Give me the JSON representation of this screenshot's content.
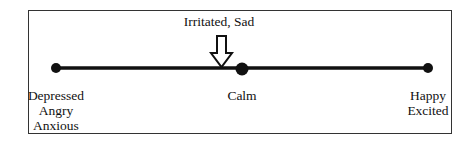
{
  "diagram": {
    "type": "mood-continuum",
    "marker_label": "Irritated, Sad",
    "scale": {
      "left": {
        "lines": [
          "Depressed",
          "Angry",
          "Anxious"
        ]
      },
      "middle": {
        "lines": [
          "Calm"
        ]
      },
      "right": {
        "lines": [
          "Happy",
          "Excited"
        ]
      }
    },
    "marker_position_fraction": 0.44,
    "colors": {
      "ink": "#111111",
      "background": "#ffffff"
    }
  }
}
